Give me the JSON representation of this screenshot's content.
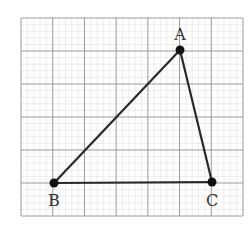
{
  "figure": {
    "type": "triangle-on-graph-paper",
    "background": "#ffffff",
    "grid": {
      "major_color": "#9a9a9a",
      "minor_color": "#e0e0e0",
      "x_start": 21,
      "x_end": 243,
      "y_start": 18,
      "y_end": 216,
      "major_cols": 7,
      "major_rows": 6,
      "minor_per_major": 5
    },
    "stroke_color": "#2a2a2a",
    "points": [
      {
        "name": "A",
        "label": "A",
        "x": 180,
        "y": 50,
        "label_x": 180,
        "label_y": 40
      },
      {
        "name": "B",
        "label": "B",
        "x": 54,
        "y": 183,
        "label_x": 54,
        "label_y": 206
      },
      {
        "name": "C",
        "label": "C",
        "x": 212,
        "y": 182,
        "label_x": 212,
        "label_y": 206
      }
    ],
    "segments": [
      {
        "from": "A",
        "to": "B"
      },
      {
        "from": "B",
        "to": "C"
      },
      {
        "from": "C",
        "to": "A"
      }
    ]
  },
  "labels": {
    "A": "A",
    "B": "B",
    "C": "C"
  }
}
